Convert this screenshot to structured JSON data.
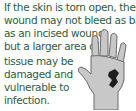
{
  "caption": {
    "lines": [
      "If the skin is torn open, the",
      "wound may not bleed as badly",
      "as an incised wound,",
      "but a larger area of",
      "tissue may be",
      "damaged and",
      "vulnerable to",
      "infection."
    ]
  },
  "illustration": {
    "subject": "hand-with-torn-wound",
    "skin_color": "#c8c8c8",
    "outline_color": "#6a6a6a",
    "wound_color": "#1e1e1e"
  }
}
